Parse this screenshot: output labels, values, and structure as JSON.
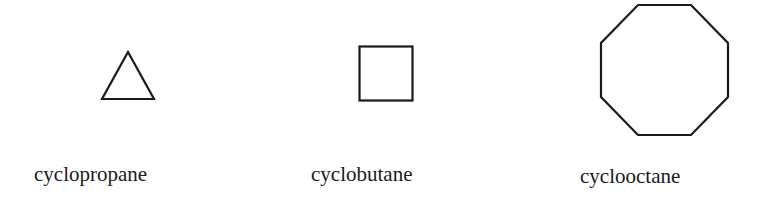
{
  "diagram": {
    "molecules": [
      {
        "name": "cyclopropane",
        "shape": "triangle",
        "sides": 3
      },
      {
        "name": "cyclobutane",
        "shape": "square",
        "sides": 4
      },
      {
        "name": "cyclooctane",
        "shape": "octagon",
        "sides": 8
      }
    ],
    "stroke_color": "#1a1a1a"
  }
}
